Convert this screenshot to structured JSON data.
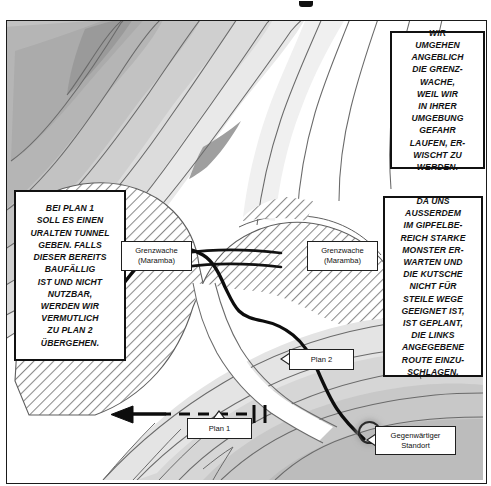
{
  "page": {
    "kind": "manga-style-route-map",
    "language": "de"
  },
  "captions": [
    {
      "id": "box-top-right",
      "name": "caption-border-guard",
      "text": "WIR\nUMGEHEN\nANGEBLICH\nDIE GRENZ-\nWACHE,\nWEIL WIR\nIN IHRER\nUMGEBUNG\nGEFAHR\nLAUFEN, ER-\nWISCHT ZU\nWERDEN."
    },
    {
      "id": "box-left",
      "name": "caption-plan-one-tunnel",
      "text": "BEI PLAN 1\nSOLL ES EINEN\nURALTEN TUNNEL\nGEBEN. FALLS\nDIESER BEREITS\nBAUFÄLLIG\nIST UND NICHT\nNUTZBAR,\nWERDEN WIR\nVERMUTLICH\nZU PLAN 2\nÜBERGEHEN."
    },
    {
      "id": "box-right",
      "name": "caption-summit-monsters",
      "text": "DA UNS\nAUSSERDEM\nIM GIPFELBE-\nREICH STARKE\nMONSTER ER-\nWARTEN UND\nDIE KUTSCHE\nNICHT FÜR\nSTEILE WEGE\nGEEIGNET IST,\nIST GEPLANT,\nDIE LINKS\nANGEGEBENE\nROUTE EINZU-\nSCHLAGEN."
    }
  ],
  "map_labels": [
    {
      "id": "label-guard-left",
      "name": "map-label-border-guard-west",
      "text": "Grenzwache\n(Maramba)"
    },
    {
      "id": "label-guard-right",
      "name": "map-label-border-guard-east",
      "text": "Grenzwache\n(Maramba)"
    },
    {
      "id": "label-plan1",
      "name": "map-label-plan-1",
      "text": "Plan 1"
    },
    {
      "id": "label-plan2",
      "name": "map-label-plan-2",
      "text": "Plan 2"
    },
    {
      "id": "label-current",
      "name": "map-label-current-location",
      "text": "Gegenwärtiger\nStandort"
    }
  ],
  "colors": {
    "ink": "#111111",
    "band_highest": "#a8a8a8",
    "band_high": "#b8b8b8",
    "band_mid": "#c8c8c8",
    "band_low": "#d8d8d8",
    "band_lowest": "#e9e9e9",
    "band_flat": "#ffffff",
    "hatch_line": "#7a7a7a",
    "route_solid": "#0d0d0d",
    "contour_line": "#6e6e6e"
  },
  "legend_semantics": {
    "solid_route": "Plan 2 – overland route along the valley",
    "dashed_route": "Plan 1 – ancient tunnel passage",
    "arrow_direction": "westward (to the left)"
  }
}
